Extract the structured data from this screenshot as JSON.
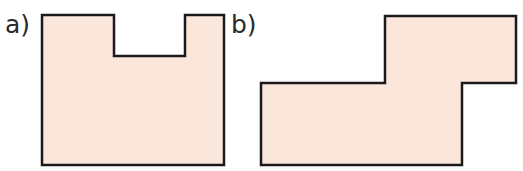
{
  "figure": {
    "labels": {
      "a": "a)",
      "b": "b)"
    },
    "fill_color": "#fbe6dc",
    "stroke_color": "#1a1a1a",
    "shapes": [
      {
        "id": "a",
        "description": "Rectangle with rectangular notch cut from top edge",
        "points": "42,15 114,15 114,56 185,56 185,15 224,15 224,165 42,165"
      },
      {
        "id": "b",
        "description": "Step-shaped polygon (two offset rectangles)",
        "points": "261,83 385,83 385,16 516,16 516,83 462,83 462,165 261,165"
      }
    ]
  }
}
